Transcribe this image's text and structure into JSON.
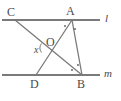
{
  "figure": {
    "type": "geometry-diagram",
    "width": 121,
    "height": 101,
    "background_color": "#ffffff",
    "stroke_color": "#7a7a7a",
    "label_color": "#4a4a4a",
    "parallel_line_width": 2.2,
    "segment_line_width": 1.3
  },
  "points": {
    "C": {
      "label": "C",
      "x": 15,
      "y": 20,
      "label_x": 7,
      "label_y": 6
    },
    "A": {
      "label": "A",
      "x": 72,
      "y": 20,
      "label_x": 66,
      "label_y": 5
    },
    "D": {
      "label": "D",
      "x": 36,
      "y": 75,
      "label_x": 30,
      "label_y": 78
    },
    "B": {
      "label": "B",
      "x": 82,
      "y": 75,
      "label_x": 77,
      "label_y": 78
    },
    "O": {
      "label": "O",
      "x": 48,
      "y": 48,
      "label_x": 46,
      "label_y": 36
    }
  },
  "lines": {
    "l": {
      "label": "l",
      "y": 20,
      "x_start": 2,
      "x_end": 100,
      "label_x": 105,
      "label_y": 13
    },
    "m": {
      "label": "m",
      "y": 75,
      "x_start": 2,
      "x_end": 100,
      "label_x": 104,
      "label_y": 68
    }
  },
  "segments": [
    {
      "name": "CB",
      "from": "C",
      "to": "B"
    },
    {
      "name": "AD",
      "from": "A",
      "to": "D"
    },
    {
      "name": "AB",
      "from": "A",
      "to": "B"
    }
  ],
  "angles": {
    "x": {
      "label": "x",
      "vertex": "O",
      "label_x": 34,
      "label_y": 45,
      "arc_radius": 8
    },
    "A_marks": [
      {
        "name": "angle-mark-A-left",
        "x": 65,
        "y": 26
      },
      {
        "name": "angle-mark-A-right",
        "x": 75,
        "y": 29
      }
    ],
    "B_marks": [
      {
        "name": "angle-mark-B-left",
        "x": 72,
        "y": 70
      },
      {
        "name": "angle-mark-B-right",
        "x": 78,
        "y": 65
      }
    ]
  }
}
